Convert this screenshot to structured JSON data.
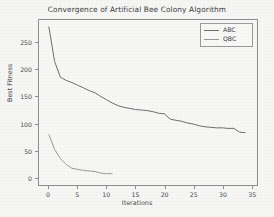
{
  "chart_data": {
    "type": "line",
    "title": "Convergence of Artificial Bee Colony Algorithm",
    "xlabel": "Iterations",
    "ylabel": "Best Fitness",
    "xlim": [
      -1.7,
      36.0
    ],
    "ylim": [
      -14,
      292
    ],
    "xticks": [
      0,
      5,
      10,
      15,
      20,
      25,
      30,
      35
    ],
    "yticks": [
      0,
      50,
      100,
      150,
      200,
      250
    ],
    "grid": false,
    "legend_position": "upper right",
    "series": [
      {
        "name": "ABC",
        "color": "#6e6e6e",
        "x": [
          0,
          1,
          2,
          3,
          4,
          5,
          6,
          7,
          8,
          9,
          10,
          11,
          12,
          13,
          14,
          15,
          16,
          17,
          18,
          19,
          20,
          21,
          22,
          23,
          24,
          25,
          26,
          27,
          28,
          29,
          30,
          31,
          32,
          33,
          34
        ],
        "values": [
          280,
          215,
          186,
          180,
          176,
          171,
          166,
          161,
          157,
          150,
          144,
          138,
          133,
          130,
          128,
          126,
          125,
          124,
          122,
          119,
          118,
          108,
          106,
          104,
          101,
          99,
          96,
          94,
          93,
          92,
          92,
          91,
          91,
          84,
          83
        ]
      },
      {
        "name": "QBC",
        "color": "#9a9a9a",
        "x": [
          0,
          1,
          2,
          3,
          4,
          5,
          6,
          7,
          8,
          9,
          10,
          11
        ],
        "values": [
          80,
          52,
          35,
          24,
          17,
          15,
          13,
          12,
          11,
          8,
          7,
          7
        ]
      }
    ]
  },
  "legend": {
    "entries": [
      {
        "label": "ABC"
      },
      {
        "label": "QBC"
      }
    ]
  },
  "axis": {
    "yticklabels": [
      "0",
      "50",
      "100",
      "150",
      "200",
      "250"
    ],
    "xticklabels": [
      "0",
      "5",
      "10",
      "15",
      "20",
      "25",
      "30",
      "35"
    ]
  }
}
